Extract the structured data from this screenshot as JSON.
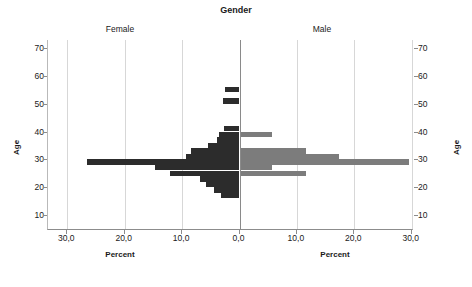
{
  "chart_data": {
    "type": "bar",
    "subtype": "population-pyramid",
    "title": "Gender",
    "xlabel": "Percent",
    "ylabel": "Age",
    "xlim": [
      -33.3,
      33.3
    ],
    "ylim": [
      8,
      74
    ],
    "grid": true,
    "legend_position": "none",
    "panels": [
      {
        "name": "Female",
        "color": "#2c2c2c",
        "side": "left"
      },
      {
        "name": "Male",
        "color": "#7c7c7c",
        "side": "right"
      }
    ],
    "x_tick_labels_left": [
      "30,0",
      "20,0",
      "10,0",
      "0,0"
    ],
    "x_tick_labels_right": [
      "10,0",
      "20,0",
      "30,0"
    ],
    "x_tick_values": [
      -30,
      -20,
      -10,
      0,
      10,
      20,
      30
    ],
    "y_tick_labels": [
      "70",
      "60",
      "50",
      "40",
      "30",
      "20",
      "10"
    ],
    "y_tick_values": [
      70,
      60,
      50,
      40,
      30,
      20,
      10
    ],
    "ages": [
      55,
      51,
      41,
      39,
      37,
      35,
      33,
      31,
      29,
      27,
      25,
      23,
      21,
      19,
      17
    ],
    "series": [
      {
        "name": "Female",
        "color": "#2c2c2c",
        "values": [
          2.6,
          2.9,
          2.7,
          3.6,
          3.9,
          5.5,
          8.4,
          9.3,
          26.6,
          14.8,
          12.1,
          6.8,
          5.9,
          4.5,
          3.3
        ]
      },
      {
        "name": "Male",
        "color": "#7c7c7c",
        "values": [
          0,
          0,
          0,
          5.7,
          0,
          0,
          11.5,
          17.4,
          29.5,
          5.6,
          11.5,
          0,
          0,
          0,
          0
        ]
      }
    ]
  },
  "axis": {
    "title": "Gender",
    "left_panel": "Female",
    "right_panel": "Male",
    "y_label_left": "Age",
    "y_label_right": "Age",
    "x_label_left": "Percent",
    "x_label_right": "Percent"
  }
}
